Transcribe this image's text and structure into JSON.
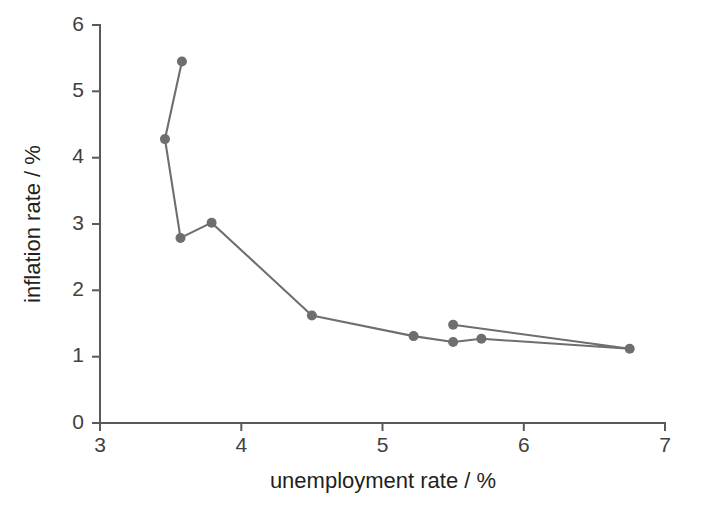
{
  "figure": {
    "background_color": "#ffffff",
    "axis_color": "#58595b",
    "series_color": "#6d6e70",
    "label_color": "#231f20"
  },
  "axis": {
    "x_title": "unemployment rate / %",
    "y_title": "inflation rate / %",
    "x_ticks": [
      "3",
      "4",
      "5",
      "6",
      "7"
    ],
    "y_ticks": [
      "0",
      "1",
      "2",
      "3",
      "4",
      "5",
      "6"
    ]
  },
  "chart_data": {
    "type": "line",
    "title": "",
    "subtitle": "",
    "xlabel": "unemployment rate / %",
    "ylabel": "inflation rate / %",
    "xlim": [
      3,
      7
    ],
    "ylim": [
      0,
      6
    ],
    "xticks": [
      3,
      4,
      5,
      6,
      7
    ],
    "yticks": [
      0,
      1,
      2,
      3,
      4,
      5,
      6
    ],
    "grid": false,
    "legend": false,
    "markers": true,
    "marker_size": 7,
    "series": [
      {
        "name": "Phillips curve path",
        "x": [
          3.58,
          3.46,
          3.57,
          3.79,
          4.5,
          5.22,
          5.5,
          5.7,
          6.75,
          5.5
        ],
        "y": [
          5.45,
          4.28,
          2.79,
          3.02,
          1.62,
          1.31,
          1.22,
          1.27,
          1.12,
          1.48
        ],
        "points": [
          {
            "x": 3.58,
            "y": 5.45
          },
          {
            "x": 3.46,
            "y": 4.28
          },
          {
            "x": 3.57,
            "y": 2.79
          },
          {
            "x": 3.79,
            "y": 3.02
          },
          {
            "x": 4.5,
            "y": 1.62
          },
          {
            "x": 5.22,
            "y": 1.31
          },
          {
            "x": 5.5,
            "y": 1.22
          },
          {
            "x": 5.7,
            "y": 1.27
          },
          {
            "x": 6.75,
            "y": 1.12
          },
          {
            "x": 5.5,
            "y": 1.48
          }
        ]
      }
    ]
  }
}
